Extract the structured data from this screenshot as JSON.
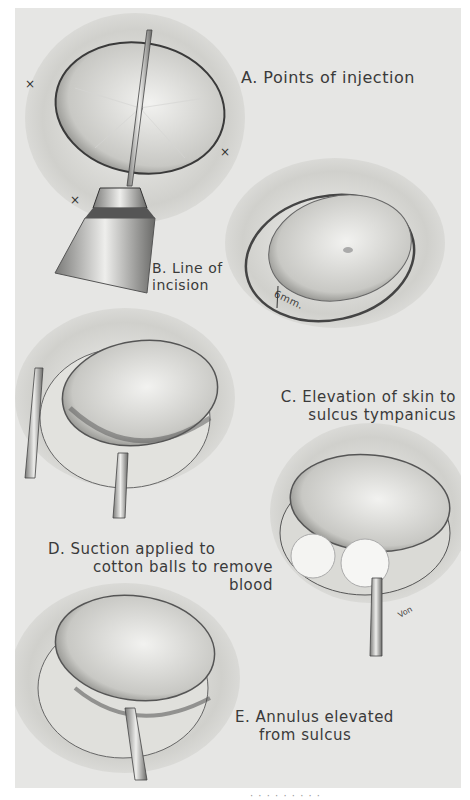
{
  "figure": {
    "labels": {
      "a": {
        "line1": "A. Points of injection"
      },
      "b": {
        "line1": "B. Line of",
        "line2": "incision"
      },
      "c": {
        "line1": "C. Elevation of skin to",
        "line2": "sulcus tympanicus"
      },
      "d": {
        "line1": "D. Suction applied to",
        "line2": "cotton balls to remove",
        "line3": "blood"
      },
      "e": {
        "line1": "E. Annulus elevated",
        "line2": "from sulcus"
      }
    },
    "measurement": "6mm.",
    "injection_marks": [
      "×",
      "×",
      "×"
    ],
    "signature": "Von",
    "caption_cutoff": "· · · · · · · · ·"
  }
}
